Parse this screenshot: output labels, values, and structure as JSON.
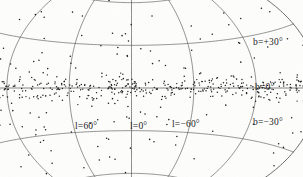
{
  "figure": {
    "type": "sky-map",
    "projection": "aitoff-hammer",
    "background_color": "#fdfdfc",
    "ink_color": "#3a3a3a",
    "point_color": "#1c1c1c"
  },
  "labels": {
    "b_plus_30": "b=+30°",
    "b_zero": "b=0°",
    "b_minus_30": "b=−30°",
    "l_plus_60": "l=60°",
    "l_zero": "l=0°",
    "l_minus_60": "l=−60°"
  },
  "chart_data": {
    "type": "scatter",
    "title": "",
    "subtitle": "",
    "xlabel": "Galactic longitude l",
    "ylabel": "Galactic latitude b",
    "projection": "aitoff",
    "grid": true,
    "legend": null,
    "xlim": [
      180,
      -180
    ],
    "ylim": [
      -90,
      90
    ],
    "x_tick_labels": [
      "l=60°",
      "l=0°",
      "l=−60°"
    ],
    "x_ticks": [
      60,
      0,
      -60
    ],
    "y_tick_labels": [
      "b=+30°",
      "b=0°",
      "b=−30°"
    ],
    "y_ticks": [
      30,
      0,
      -30
    ],
    "graticule": {
      "meridians_deg": [
        -180,
        -120,
        -60,
        0,
        60,
        120,
        180
      ],
      "parallels_deg": [
        -60,
        -30,
        0,
        30,
        60
      ]
    },
    "n_points": 620,
    "concentration": "strong galactic-plane clustering within |b| < 5 degrees",
    "series": [
      {
        "name": "sources",
        "marker": "dot",
        "color": "#1c1c1c",
        "distribution": {
          "l_uniform_range": [
            -180,
            180
          ],
          "b_model": "two-component: narrow disk (sigma_b = 3.5 deg, 74%) plus broad halo (sigma_b = 30 deg, 26%)",
          "disk_fraction": 0.74,
          "disk_sigma_b_deg": 3.5,
          "halo_fraction": 0.26,
          "halo_sigma_b_deg": 30
        }
      }
    ]
  }
}
